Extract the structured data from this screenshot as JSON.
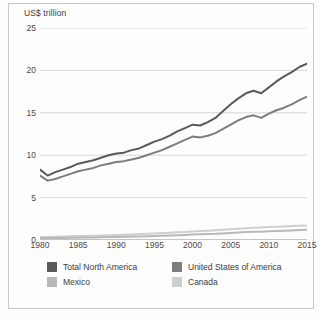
{
  "chart_data": {
    "type": "line",
    "title": "",
    "ylabel": "US$ trillion",
    "xlabel": "",
    "ylim": [
      0,
      25
    ],
    "xlim": [
      1980,
      2015
    ],
    "yticks": [
      0,
      5,
      10,
      15,
      20,
      25
    ],
    "xticks": [
      1980,
      1985,
      1990,
      1995,
      2000,
      2005,
      2010,
      2015
    ],
    "grid": true,
    "legend_position": "bottom",
    "x": [
      1980,
      1981,
      1982,
      1983,
      1984,
      1985,
      1986,
      1987,
      1988,
      1989,
      1990,
      1991,
      1992,
      1993,
      1994,
      1995,
      1996,
      1997,
      1998,
      1999,
      2000,
      2001,
      2002,
      2003,
      2004,
      2005,
      2006,
      2007,
      2008,
      2009,
      2010,
      2011,
      2012,
      2013,
      2014,
      2015
    ],
    "series": [
      {
        "name": "Total North America",
        "color": "#5a5a5a",
        "values": [
          8.3,
          7.6,
          8.0,
          8.3,
          8.6,
          9.0,
          9.2,
          9.4,
          9.7,
          10.0,
          10.2,
          10.3,
          10.6,
          10.8,
          11.2,
          11.6,
          11.9,
          12.3,
          12.8,
          13.2,
          13.6,
          13.5,
          13.9,
          14.4,
          15.2,
          16.0,
          16.7,
          17.3,
          17.6,
          17.3,
          18.0,
          18.7,
          19.3,
          19.8,
          20.4,
          20.8
        ]
      },
      {
        "name": "United States of America",
        "color": "#7d7d7d",
        "values": [
          7.6,
          7.0,
          7.2,
          7.5,
          7.8,
          8.1,
          8.3,
          8.5,
          8.8,
          9.0,
          9.2,
          9.3,
          9.5,
          9.7,
          10.0,
          10.3,
          10.6,
          11.0,
          11.4,
          11.8,
          12.2,
          12.1,
          12.3,
          12.6,
          13.1,
          13.6,
          14.1,
          14.5,
          14.7,
          14.4,
          14.9,
          15.3,
          15.6,
          16.0,
          16.5,
          16.9
        ]
      },
      {
        "name": "Mexico",
        "color": "#b8b8b8",
        "values": [
          0.2,
          0.23,
          0.24,
          0.25,
          0.26,
          0.28,
          0.29,
          0.3,
          0.32,
          0.34,
          0.36,
          0.38,
          0.4,
          0.42,
          0.45,
          0.47,
          0.5,
          0.53,
          0.56,
          0.6,
          0.64,
          0.67,
          0.7,
          0.73,
          0.78,
          0.83,
          0.88,
          0.93,
          0.97,
          0.98,
          1.02,
          1.06,
          1.1,
          1.13,
          1.17,
          1.2
        ]
      },
      {
        "name": "Canada",
        "color": "#cfcfcf",
        "values": [
          0.34,
          0.36,
          0.38,
          0.4,
          0.43,
          0.46,
          0.48,
          0.5,
          0.53,
          0.56,
          0.6,
          0.63,
          0.66,
          0.7,
          0.74,
          0.78,
          0.82,
          0.86,
          0.9,
          0.95,
          1.0,
          1.05,
          1.1,
          1.15,
          1.2,
          1.26,
          1.32,
          1.38,
          1.44,
          1.48,
          1.52,
          1.57,
          1.6,
          1.64,
          1.67,
          1.7
        ]
      }
    ]
  },
  "legend": {
    "items": [
      {
        "label": "Total North America",
        "color": "#5a5a5a"
      },
      {
        "label": "United States of America",
        "color": "#7d7d7d"
      },
      {
        "label": "Mexico",
        "color": "#b8b8b8"
      },
      {
        "label": "Canada",
        "color": "#cfcfcf"
      }
    ]
  },
  "colors": {
    "grid": "#d8d8d8",
    "axis": "#8a8a8a",
    "text": "#3c3c3c",
    "frame": "#c9c9c9",
    "background": "#fdfdfd"
  }
}
